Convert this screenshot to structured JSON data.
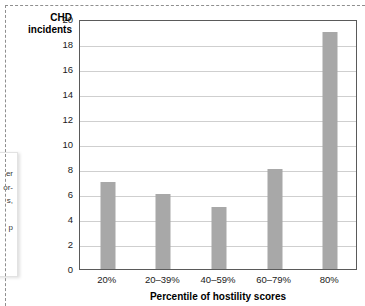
{
  "figure": {
    "frame_style": "dashed",
    "frame_color": "#8f8f8f"
  },
  "side_note": {
    "fragments": [
      "er",
      "or-",
      "s,",
      "p"
    ],
    "note": "partially visible text block cut off at the left edge"
  },
  "chart_data": {
    "type": "bar",
    "title": "",
    "subtitle": "",
    "xlabel": "Percentile of hostility scores",
    "ylabel": "CHD incidents",
    "ylabel_line1": "CHD",
    "ylabel_line2": "incidents",
    "categories": [
      "20%",
      "20–39%",
      "40–59%",
      "60–79%",
      "80%"
    ],
    "values": [
      7,
      6,
      5,
      8,
      19
    ],
    "ylim": [
      0,
      20
    ],
    "ytick_step": 2,
    "yticks": [
      0,
      2,
      4,
      6,
      8,
      10,
      12,
      14,
      16,
      18,
      20
    ],
    "ytick_labels": [
      "0",
      "2",
      "4",
      "6",
      "8",
      "10",
      "12",
      "14",
      "16",
      "18",
      "20"
    ],
    "grid": true,
    "grid_axis": "y",
    "legend": false,
    "legend_position": "none",
    "bar_color": "#a8a8a8",
    "grid_color": "#cfcfcf",
    "axis_color": "#5a5a5a",
    "plot_background": "#ffffff"
  }
}
